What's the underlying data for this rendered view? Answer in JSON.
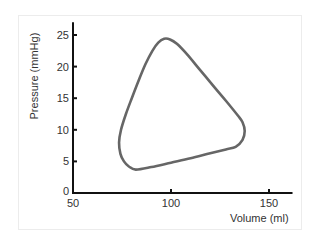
{
  "chart_data": {
    "type": "line",
    "title": "",
    "xlabel": "Volume (ml)",
    "ylabel": "Pressure (mmHg)",
    "xlim": [
      50,
      162
    ],
    "ylim": [
      0,
      27
    ],
    "x_ticks": [
      50,
      100,
      150
    ],
    "y_ticks": [
      0,
      5,
      10,
      15,
      20,
      25
    ],
    "grid": false,
    "legend": "none",
    "series": [
      {
        "name": "Pressure-volume loop",
        "color": "#666666",
        "closed": true,
        "points": [
          [
            82,
            3.7
          ],
          [
            90,
            4.1
          ],
          [
            100,
            4.8
          ],
          [
            110,
            5.5
          ],
          [
            120,
            6.3
          ],
          [
            128,
            6.9
          ],
          [
            133,
            7.3
          ],
          [
            136.5,
            8.4
          ],
          [
            137.6,
            9.8
          ],
          [
            136.5,
            11.2
          ],
          [
            134,
            12.3
          ],
          [
            128,
            14.6
          ],
          [
            122,
            16.8
          ],
          [
            115,
            19.4
          ],
          [
            108,
            22.0
          ],
          [
            103,
            23.6
          ],
          [
            99.5,
            24.3
          ],
          [
            96.5,
            24.4
          ],
          [
            93.5,
            23.8
          ],
          [
            90.5,
            22.5
          ],
          [
            87,
            20.4
          ],
          [
            83.5,
            17.8
          ],
          [
            80,
            15.0
          ],
          [
            77,
            12.5
          ],
          [
            74.5,
            10.0
          ],
          [
            73.5,
            8.0
          ],
          [
            74.2,
            6.2
          ],
          [
            76,
            5.0
          ],
          [
            78.5,
            4.2
          ]
        ]
      }
    ]
  }
}
